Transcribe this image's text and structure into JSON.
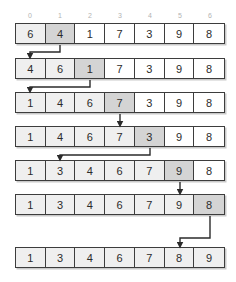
{
  "diagram": {
    "index_labels": [
      "0",
      "1",
      "2",
      "3",
      "4",
      "5",
      "6"
    ],
    "colors": {
      "border": "#3d3d3d",
      "shade_light": "#efefef",
      "shade_dark": "#d4d4d4",
      "index_text": "#b3b3b3",
      "value_text": "#2b2b2b",
      "shadow": "#c9c9c9",
      "arrow": "#2b2b2b"
    },
    "rows": [
      {
        "step": "1",
        "values": [
          "6",
          "4",
          "1",
          "7",
          "3",
          "9",
          "8"
        ],
        "shading": [
          "light",
          "dark",
          "none",
          "none",
          "none",
          "none",
          "none"
        ]
      },
      {
        "step": "2",
        "values": [
          "4",
          "6",
          "1",
          "7",
          "3",
          "9",
          "8"
        ],
        "shading": [
          "light",
          "light",
          "dark",
          "none",
          "none",
          "none",
          "none"
        ]
      },
      {
        "step": "3",
        "values": [
          "1",
          "4",
          "6",
          "7",
          "3",
          "9",
          "8"
        ],
        "shading": [
          "light",
          "light",
          "light",
          "dark",
          "none",
          "none",
          "none"
        ]
      },
      {
        "step": "4",
        "values": [
          "1",
          "4",
          "6",
          "7",
          "3",
          "9",
          "8"
        ],
        "shading": [
          "light",
          "light",
          "light",
          "light",
          "dark",
          "none",
          "none"
        ]
      },
      {
        "step": "5",
        "values": [
          "1",
          "3",
          "4",
          "6",
          "7",
          "9",
          "8"
        ],
        "shading": [
          "light",
          "light",
          "light",
          "light",
          "light",
          "dark",
          "none"
        ]
      },
      {
        "step": "6",
        "values": [
          "1",
          "3",
          "4",
          "6",
          "7",
          "9",
          "8"
        ],
        "shading": [
          "light",
          "light",
          "light",
          "light",
          "light",
          "light",
          "dark"
        ]
      },
      {
        "step": "7",
        "values": [
          "1",
          "3",
          "4",
          "6",
          "7",
          "8",
          "9"
        ],
        "shading": [
          "light",
          "light",
          "light",
          "light",
          "light",
          "light",
          "light"
        ]
      }
    ],
    "arrows": [
      {
        "name": "arrow-step1-to-step2",
        "from_index": 1,
        "to_index": 0,
        "kind": "elbow-left"
      },
      {
        "name": "arrow-step2-to-step3",
        "from_index": 2,
        "to_index": 0,
        "kind": "elbow-left"
      },
      {
        "name": "arrow-step3-to-step4",
        "from_index": 3,
        "to_index": 3,
        "kind": "straight"
      },
      {
        "name": "arrow-step4-to-step5",
        "from_index": 4,
        "to_index": 1,
        "kind": "elbow-left"
      },
      {
        "name": "arrow-step5-to-step6",
        "from_index": 5,
        "to_index": 5,
        "kind": "straight"
      },
      {
        "name": "arrow-step6-to-step7",
        "from_index": 6,
        "to_index": 5,
        "kind": "elbow-left"
      }
    ]
  }
}
